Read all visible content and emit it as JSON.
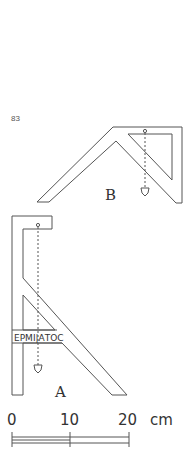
{
  "page": {
    "number": "83"
  },
  "figures": [
    {
      "id": "B",
      "label": "B",
      "description": "Inverted-V plumb-line level (chorobates/A-frame style) with plumb bob"
    },
    {
      "id": "A",
      "label": "A",
      "inscription": "ΕΡΜΙ|ΑΤΟϹ",
      "description": "A-shaped plumb-level with inscribed crossbar and plumb bob"
    }
  ],
  "scale_bar": {
    "ticks": [
      "0",
      "10",
      "20"
    ],
    "unit": "cm"
  }
}
